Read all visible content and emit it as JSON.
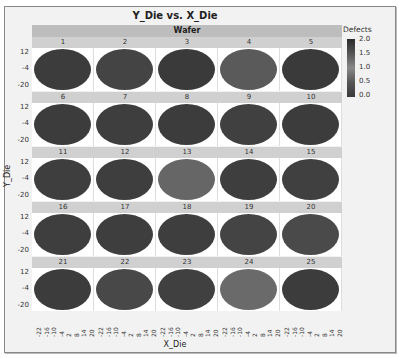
{
  "chart_data": {
    "type": "heatmap",
    "title": "Y_Die vs. X_Die",
    "group_header": "Wafer",
    "xlabel": "X_Die",
    "ylabel": "Y_Die",
    "x_ticks": [
      "-22",
      "-16",
      "-10",
      "-4",
      "2",
      "8",
      "14",
      "20"
    ],
    "y_ticks": [
      "12",
      "-4",
      "-20"
    ],
    "legend": {
      "title": "Defects",
      "ticks": [
        "2.0",
        "1.5",
        "1.0",
        "0.5",
        "0.0"
      ],
      "range": [
        0,
        2
      ]
    },
    "panels": [
      {
        "wafer": "1",
        "shade": "#3c3c3c"
      },
      {
        "wafer": "2",
        "shade": "#444444"
      },
      {
        "wafer": "3",
        "shade": "#3a3a3a"
      },
      {
        "wafer": "4",
        "shade": "#5a5a5a"
      },
      {
        "wafer": "5",
        "shade": "#3a3a3a"
      },
      {
        "wafer": "6",
        "shade": "#3c3c3c"
      },
      {
        "wafer": "7",
        "shade": "#3e3e3e"
      },
      {
        "wafer": "8",
        "shade": "#3c3c3c"
      },
      {
        "wafer": "9",
        "shade": "#404040"
      },
      {
        "wafer": "10",
        "shade": "#3c3c3c"
      },
      {
        "wafer": "11",
        "shade": "#3e3e3e"
      },
      {
        "wafer": "12",
        "shade": "#3e3e3e"
      },
      {
        "wafer": "13",
        "shade": "#666666"
      },
      {
        "wafer": "14",
        "shade": "#3e3e3e"
      },
      {
        "wafer": "15",
        "shade": "#404040"
      },
      {
        "wafer": "16",
        "shade": "#3e3e3e"
      },
      {
        "wafer": "17",
        "shade": "#3e3e3e"
      },
      {
        "wafer": "18",
        "shade": "#3e3e3e"
      },
      {
        "wafer": "19",
        "shade": "#444444"
      },
      {
        "wafer": "20",
        "shade": "#4a4a4a"
      },
      {
        "wafer": "21",
        "shade": "#3c3c3c"
      },
      {
        "wafer": "22",
        "shade": "#484848"
      },
      {
        "wafer": "23",
        "shade": "#404040"
      },
      {
        "wafer": "24",
        "shade": "#6a6a6a"
      },
      {
        "wafer": "25",
        "shade": "#3c3c3c"
      }
    ]
  }
}
